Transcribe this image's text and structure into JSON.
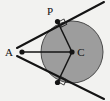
{
  "figure": {
    "type": "geometry-diagram",
    "background_color": "#f2f2f0",
    "stroke_color": "#141414",
    "circle": {
      "label": "C",
      "center_x": 72,
      "center_y": 52,
      "radius": 31,
      "fill_color": "#9d9d9d",
      "stroke_color": "#4a4a4a"
    },
    "points": [
      {
        "name": "A",
        "label": "A",
        "x": 22,
        "y": 52,
        "label_x": 9,
        "label_y": 56,
        "dot_radius": 2.6
      },
      {
        "name": "P",
        "label": "P",
        "x": 57.5,
        "y": 21.5,
        "label_x": 50,
        "label_y": 14,
        "dot_radius": 2.6
      },
      {
        "name": "Q",
        "label": "",
        "x": 57.5,
        "y": 82.5,
        "label_x": 0,
        "label_y": 0,
        "dot_radius": 2.6
      },
      {
        "name": "C",
        "label": "C",
        "x": 72,
        "y": 52,
        "label_x": 78,
        "label_y": 56,
        "dot_radius": 2.6
      }
    ],
    "segments": [
      {
        "name": "segment-a-c",
        "x1": 22,
        "y1": 52,
        "x2": 72,
        "y2": 52,
        "width": 1.3
      },
      {
        "name": "radius-c-p",
        "x1": 72,
        "y1": 52,
        "x2": 57.5,
        "y2": 21.5,
        "width": 1.5
      },
      {
        "name": "radius-c-q",
        "x1": 72,
        "y1": 52,
        "x2": 57.5,
        "y2": 82.5,
        "width": 1.5
      }
    ],
    "tangent_lines": [
      {
        "name": "tangent-upper",
        "x1": 17,
        "y1": 48,
        "x2": 104,
        "y2": 2,
        "width": 2.0
      },
      {
        "name": "tangent-lower",
        "x1": 17,
        "y1": 56,
        "x2": 104,
        "y2": 99,
        "width": 2.0
      }
    ],
    "right_angle_markers": [
      {
        "name": "right-angle-at-p",
        "x": 57.5,
        "y": 21.5,
        "size": 6.5,
        "rotation": -28
      },
      {
        "name": "right-angle-at-q",
        "x": 57.5,
        "y": 82.5,
        "size": 6.5,
        "rotation": 28
      }
    ]
  },
  "labels": {
    "a": "A",
    "p": "P",
    "c": "C"
  }
}
